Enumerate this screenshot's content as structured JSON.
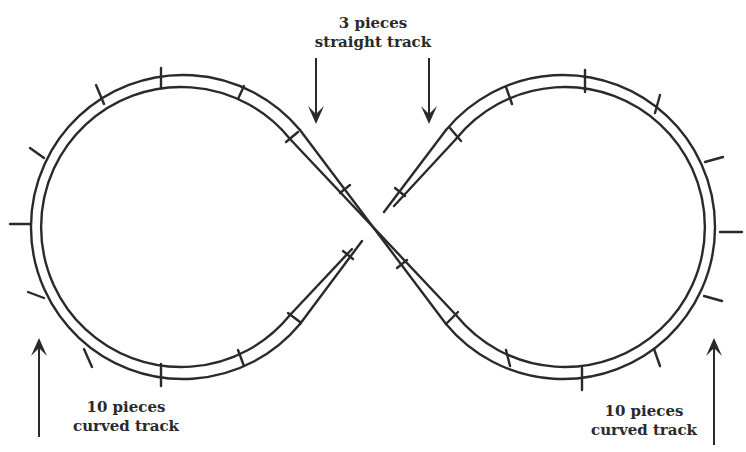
{
  "diagram": {
    "type": "figure-eight model railway track layout",
    "colors": {
      "ink": "#2a2a2a",
      "background": "#ffffff"
    },
    "labels": {
      "top": {
        "line1": "3 pieces",
        "line2": "straight track"
      },
      "left": {
        "line1": "10 pieces",
        "line2": "curved track"
      },
      "right": {
        "line1": "10 pieces",
        "line2": "curved track"
      }
    },
    "components": [
      {
        "name": "curved track (left loop)",
        "count": 10
      },
      {
        "name": "straight track (crossing)",
        "count": 3
      },
      {
        "name": "curved track (right loop)",
        "count": 10
      }
    ],
    "arrows": [
      {
        "label_ref": "top",
        "direction": "down",
        "target": "left straight"
      },
      {
        "label_ref": "top",
        "direction": "down",
        "target": "right straight"
      },
      {
        "label_ref": "left",
        "direction": "up",
        "target": "left loop"
      },
      {
        "label_ref": "right",
        "direction": "up",
        "target": "right loop"
      }
    ]
  }
}
